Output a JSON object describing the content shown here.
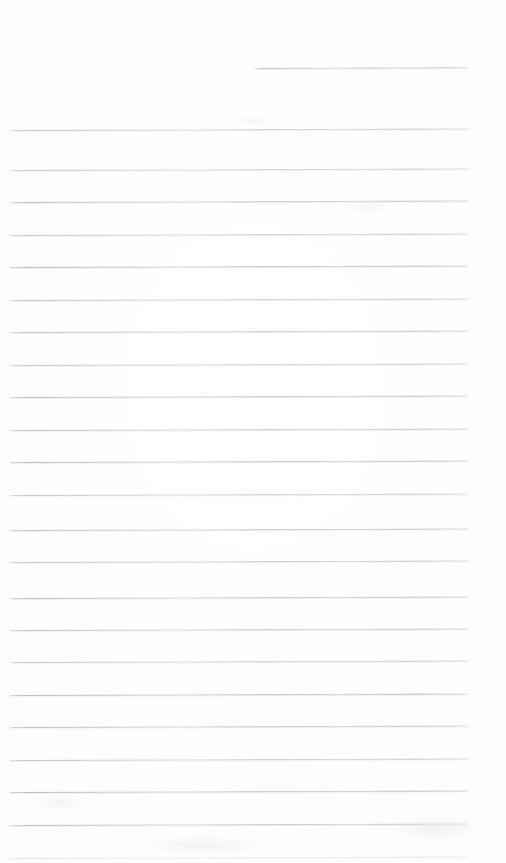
{
  "document": {
    "kind": "scanned-blank-lined-notebook-page",
    "title": "Blank ruled notepad page",
    "page_width": 506,
    "page_height": 863,
    "background_color": "#fefefe",
    "rule_color": "#b0b4ba",
    "content_text": "",
    "handwriting_present": false,
    "margin_rule_present": false,
    "header_text": "",
    "footer_text": "",
    "page_number": ""
  },
  "ruling": {
    "line_count": 24,
    "full_line_count": 23,
    "partial_line_count": 1,
    "spacing_px": 32.5,
    "left_margin_px": 10,
    "right_margin_px": 468,
    "line_thickness_px": 1,
    "tilt_degrees": -0.18,
    "lines": [
      {
        "index": 0,
        "y": 68,
        "x1": 255,
        "x2": 468,
        "partial": true,
        "opacity": 0.78
      },
      {
        "index": 1,
        "y": 130,
        "x1": 10,
        "x2": 468,
        "partial": false,
        "opacity": 0.72
      },
      {
        "index": 2,
        "y": 170,
        "x1": 10,
        "x2": 468,
        "partial": false,
        "opacity": 0.7
      },
      {
        "index": 3,
        "y": 202,
        "x1": 10,
        "x2": 468,
        "partial": false,
        "opacity": 0.82
      },
      {
        "index": 4,
        "y": 235,
        "x1": 10,
        "x2": 468,
        "partial": false,
        "opacity": 0.74
      },
      {
        "index": 5,
        "y": 267,
        "x1": 10,
        "x2": 468,
        "partial": false,
        "opacity": 0.88
      },
      {
        "index": 6,
        "y": 300,
        "x1": 10,
        "x2": 468,
        "partial": false,
        "opacity": 0.76
      },
      {
        "index": 7,
        "y": 332,
        "x1": 10,
        "x2": 468,
        "partial": false,
        "opacity": 0.8
      },
      {
        "index": 8,
        "y": 365,
        "x1": 10,
        "x2": 468,
        "partial": false,
        "opacity": 0.72
      },
      {
        "index": 9,
        "y": 397,
        "x1": 10,
        "x2": 468,
        "partial": false,
        "opacity": 0.84
      },
      {
        "index": 10,
        "y": 430,
        "x1": 10,
        "x2": 468,
        "partial": false,
        "opacity": 0.78
      },
      {
        "index": 11,
        "y": 462,
        "x1": 10,
        "x2": 468,
        "partial": false,
        "opacity": 0.86
      },
      {
        "index": 12,
        "y": 495,
        "x1": 10,
        "x2": 468,
        "partial": false,
        "opacity": 0.74
      },
      {
        "index": 13,
        "y": 530,
        "x1": 10,
        "x2": 468,
        "partial": false,
        "opacity": 0.8
      },
      {
        "index": 14,
        "y": 562,
        "x1": 10,
        "x2": 468,
        "partial": false,
        "opacity": 0.76
      },
      {
        "index": 15,
        "y": 598,
        "x1": 10,
        "x2": 468,
        "partial": false,
        "opacity": 0.84
      },
      {
        "index": 16,
        "y": 630,
        "x1": 10,
        "x2": 468,
        "partial": false,
        "opacity": 0.78
      },
      {
        "index": 17,
        "y": 662,
        "x1": 10,
        "x2": 468,
        "partial": false,
        "opacity": 0.72
      },
      {
        "index": 18,
        "y": 695,
        "x1": 10,
        "x2": 468,
        "partial": false,
        "opacity": 0.88
      },
      {
        "index": 19,
        "y": 727,
        "x1": 10,
        "x2": 468,
        "partial": false,
        "opacity": 0.82
      },
      {
        "index": 20,
        "y": 760,
        "x1": 10,
        "x2": 468,
        "partial": false,
        "opacity": 0.76
      },
      {
        "index": 21,
        "y": 792,
        "x1": 10,
        "x2": 468,
        "partial": false,
        "opacity": 0.86
      },
      {
        "index": 22,
        "y": 825,
        "x1": 10,
        "x2": 468,
        "partial": false,
        "opacity": 0.8
      },
      {
        "index": 23,
        "y": 858,
        "x1": 10,
        "x2": 468,
        "partial": false,
        "opacity": 0.3
      }
    ]
  }
}
